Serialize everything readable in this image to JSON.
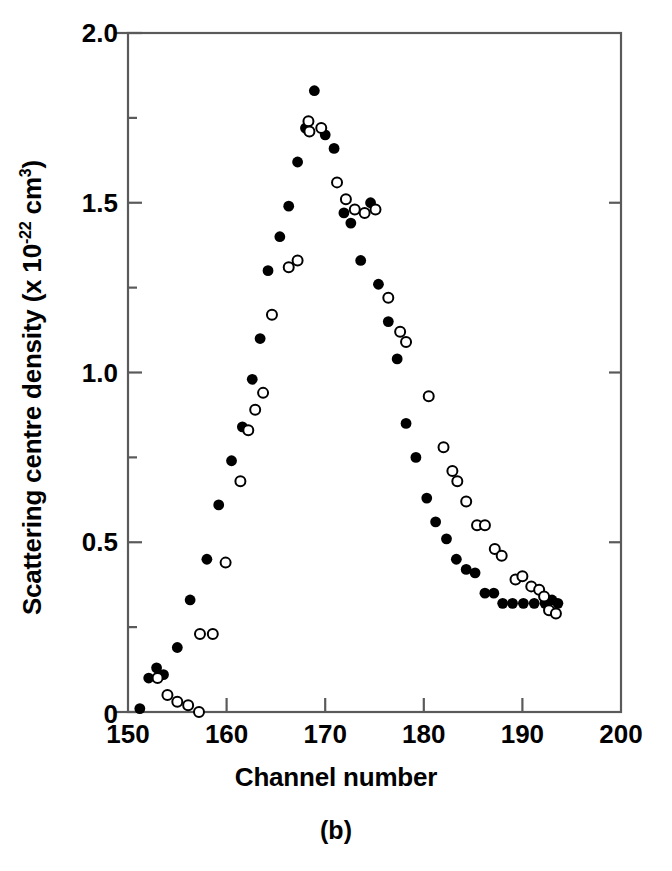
{
  "figure": {
    "caption": "(b)"
  },
  "chart_data": {
    "type": "scatter",
    "title": "",
    "xlabel": "Channel number",
    "ylabel": "Scattering centre density (x 10-22 cm3)",
    "ylabel_parts": {
      "lead": "Scattering centre density (x 10",
      "exp1": "-22",
      "mid": " cm",
      "exp2": "3",
      "tail": ")"
    },
    "xlim": [
      150,
      200
    ],
    "ylim": [
      0,
      2.0
    ],
    "grid": false,
    "legend_position": "none",
    "xticks": [
      150,
      160,
      170,
      180,
      190,
      200
    ],
    "xtick_labels": [
      "150",
      "160",
      "170",
      "180",
      "190",
      "200"
    ],
    "xminor_step": 5,
    "yticks": [
      0,
      0.5,
      1.0,
      1.5,
      2.0
    ],
    "ytick_labels": [
      "0",
      "0.5",
      "1.0",
      "1.5",
      "2.0"
    ],
    "yminor_step": 0.25,
    "series": [
      {
        "name": "filled",
        "marker": "filled-circle",
        "color": "#000000",
        "points": [
          [
            151.2,
            0.01
          ],
          [
            152.1,
            0.1
          ],
          [
            152.9,
            0.13
          ],
          [
            153.6,
            0.11
          ],
          [
            155.0,
            0.19
          ],
          [
            156.3,
            0.33
          ],
          [
            158.0,
            0.45
          ],
          [
            159.2,
            0.61
          ],
          [
            160.5,
            0.74
          ],
          [
            161.6,
            0.84
          ],
          [
            162.6,
            0.98
          ],
          [
            163.4,
            1.1
          ],
          [
            164.2,
            1.3
          ],
          [
            165.4,
            1.4
          ],
          [
            166.3,
            1.49
          ],
          [
            167.2,
            1.62
          ],
          [
            168.0,
            1.72
          ],
          [
            168.9,
            1.83
          ],
          [
            170.0,
            1.7
          ],
          [
            170.9,
            1.66
          ],
          [
            171.9,
            1.47
          ],
          [
            172.6,
            1.44
          ],
          [
            173.6,
            1.33
          ],
          [
            174.6,
            1.5
          ],
          [
            175.4,
            1.26
          ],
          [
            176.4,
            1.15
          ],
          [
            177.3,
            1.04
          ],
          [
            178.2,
            0.85
          ],
          [
            179.2,
            0.75
          ],
          [
            180.3,
            0.63
          ],
          [
            181.2,
            0.56
          ],
          [
            182.3,
            0.51
          ],
          [
            183.3,
            0.45
          ],
          [
            184.3,
            0.42
          ],
          [
            185.2,
            0.41
          ],
          [
            186.2,
            0.35
          ],
          [
            187.1,
            0.35
          ],
          [
            188.0,
            0.32
          ],
          [
            189.0,
            0.32
          ],
          [
            190.1,
            0.32
          ],
          [
            191.2,
            0.32
          ],
          [
            192.3,
            0.32
          ],
          [
            193.0,
            0.33
          ],
          [
            193.6,
            0.32
          ]
        ]
      },
      {
        "name": "open",
        "marker": "open-circle",
        "color": "#000000",
        "points": [
          [
            153.0,
            0.1
          ],
          [
            154.0,
            0.05
          ],
          [
            155.0,
            0.03
          ],
          [
            156.1,
            0.02
          ],
          [
            157.2,
            0.0
          ],
          [
            157.3,
            0.23
          ],
          [
            158.6,
            0.23
          ],
          [
            159.9,
            0.44
          ],
          [
            161.4,
            0.68
          ],
          [
            162.2,
            0.83
          ],
          [
            162.9,
            0.89
          ],
          [
            163.7,
            0.94
          ],
          [
            164.6,
            1.17
          ],
          [
            166.3,
            1.31
          ],
          [
            167.2,
            1.33
          ],
          [
            168.3,
            1.74
          ],
          [
            168.4,
            1.71
          ],
          [
            169.6,
            1.72
          ],
          [
            171.2,
            1.56
          ],
          [
            172.1,
            1.51
          ],
          [
            173.0,
            1.48
          ],
          [
            174.0,
            1.47
          ],
          [
            175.1,
            1.48
          ],
          [
            176.4,
            1.22
          ],
          [
            177.6,
            1.12
          ],
          [
            178.2,
            1.09
          ],
          [
            180.5,
            0.93
          ],
          [
            182.0,
            0.78
          ],
          [
            182.9,
            0.71
          ],
          [
            183.4,
            0.68
          ],
          [
            184.3,
            0.62
          ],
          [
            185.4,
            0.55
          ],
          [
            186.2,
            0.55
          ],
          [
            187.2,
            0.48
          ],
          [
            187.9,
            0.46
          ],
          [
            189.3,
            0.39
          ],
          [
            190.0,
            0.4
          ],
          [
            190.9,
            0.37
          ],
          [
            191.7,
            0.36
          ],
          [
            192.2,
            0.34
          ],
          [
            192.7,
            0.3
          ],
          [
            193.4,
            0.29
          ]
        ]
      }
    ]
  }
}
